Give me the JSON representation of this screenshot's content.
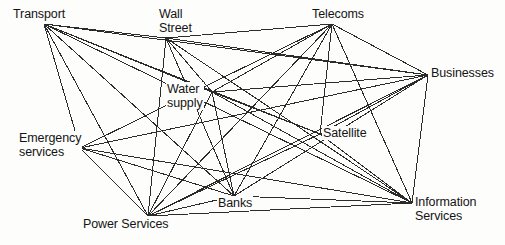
{
  "diagram": {
    "type": "network-graph",
    "title": "",
    "stroke_color": "#2b2b2b",
    "background_color": "#fdfdfc",
    "text_color": "#141414",
    "nodes": [
      {
        "id": "transport",
        "label": "Transport",
        "lines": [
          "Transport"
        ],
        "x": 12,
        "y": 7,
        "anchor_x": 44,
        "anchor_y": 24
      },
      {
        "id": "wall_street",
        "label": "Wall Street",
        "lines": [
          "Wall",
          "Street"
        ],
        "x": 158,
        "y": 7,
        "anchor_x": 166,
        "anchor_y": 38
      },
      {
        "id": "telecoms",
        "label": "Telecoms",
        "lines": [
          "Telecoms"
        ],
        "x": 311,
        "y": 7,
        "anchor_x": 332,
        "anchor_y": 24
      },
      {
        "id": "businesses",
        "label": "Businesses",
        "lines": [
          "Businesses"
        ],
        "x": 430,
        "y": 66,
        "anchor_x": 428,
        "anchor_y": 75
      },
      {
        "id": "water",
        "label": "Water supply",
        "lines": [
          "Water",
          "supply"
        ],
        "x": 166,
        "y": 82,
        "anchor_x": 212,
        "anchor_y": 92
      },
      {
        "id": "satellite",
        "label": "Satellite",
        "lines": [
          "Satellite"
        ],
        "x": 322,
        "y": 126,
        "anchor_x": 320,
        "anchor_y": 134
      },
      {
        "id": "emergency",
        "label": "Emergency services",
        "lines": [
          "Emergency",
          "services"
        ],
        "x": 18,
        "y": 131,
        "anchor_x": 80,
        "anchor_y": 148
      },
      {
        "id": "banks",
        "label": "Banks",
        "lines": [
          "Banks"
        ],
        "x": 217,
        "y": 196,
        "anchor_x": 234,
        "anchor_y": 196
      },
      {
        "id": "power",
        "label": "Power Services",
        "lines": [
          "Power Services"
        ],
        "x": 82,
        "y": 217,
        "anchor_x": 148,
        "anchor_y": 216
      },
      {
        "id": "info",
        "label": "Information Services",
        "lines": [
          "Information",
          "Services"
        ],
        "x": 414,
        "y": 195,
        "anchor_x": 412,
        "anchor_y": 203
      }
    ],
    "edges": [
      {
        "from": "transport",
        "to": "wall_street"
      },
      {
        "from": "wall_street",
        "to": "telecoms"
      },
      {
        "from": "transport",
        "to": "emergency"
      },
      {
        "from": "transport",
        "to": "water"
      },
      {
        "from": "transport",
        "to": "satellite"
      },
      {
        "from": "transport",
        "to": "banks"
      },
      {
        "from": "transport",
        "to": "businesses"
      },
      {
        "from": "transport",
        "to": "info"
      },
      {
        "from": "transport",
        "to": "power"
      },
      {
        "from": "wall_street",
        "to": "water"
      },
      {
        "from": "wall_street",
        "to": "banks"
      },
      {
        "from": "wall_street",
        "to": "power"
      },
      {
        "from": "wall_street",
        "to": "info"
      },
      {
        "from": "wall_street",
        "to": "businesses"
      },
      {
        "from": "telecoms",
        "to": "water"
      },
      {
        "from": "telecoms",
        "to": "emergency"
      },
      {
        "from": "telecoms",
        "to": "power"
      },
      {
        "from": "telecoms",
        "to": "banks"
      },
      {
        "from": "telecoms",
        "to": "satellite"
      },
      {
        "from": "telecoms",
        "to": "businesses"
      },
      {
        "from": "telecoms",
        "to": "info"
      },
      {
        "from": "water",
        "to": "businesses"
      },
      {
        "from": "water",
        "to": "satellite"
      },
      {
        "from": "water",
        "to": "info"
      },
      {
        "from": "water",
        "to": "power"
      },
      {
        "from": "water",
        "to": "banks"
      },
      {
        "from": "emergency",
        "to": "businesses"
      },
      {
        "from": "emergency",
        "to": "power"
      },
      {
        "from": "emergency",
        "to": "banks"
      },
      {
        "from": "emergency",
        "to": "info"
      },
      {
        "from": "satellite",
        "to": "power"
      },
      {
        "from": "satellite",
        "to": "info"
      },
      {
        "from": "satellite",
        "to": "businesses"
      },
      {
        "from": "banks",
        "to": "businesses"
      },
      {
        "from": "banks",
        "to": "info"
      },
      {
        "from": "power",
        "to": "banks"
      },
      {
        "from": "power",
        "to": "info"
      },
      {
        "from": "power",
        "to": "businesses"
      },
      {
        "from": "businesses",
        "to": "info"
      }
    ]
  }
}
